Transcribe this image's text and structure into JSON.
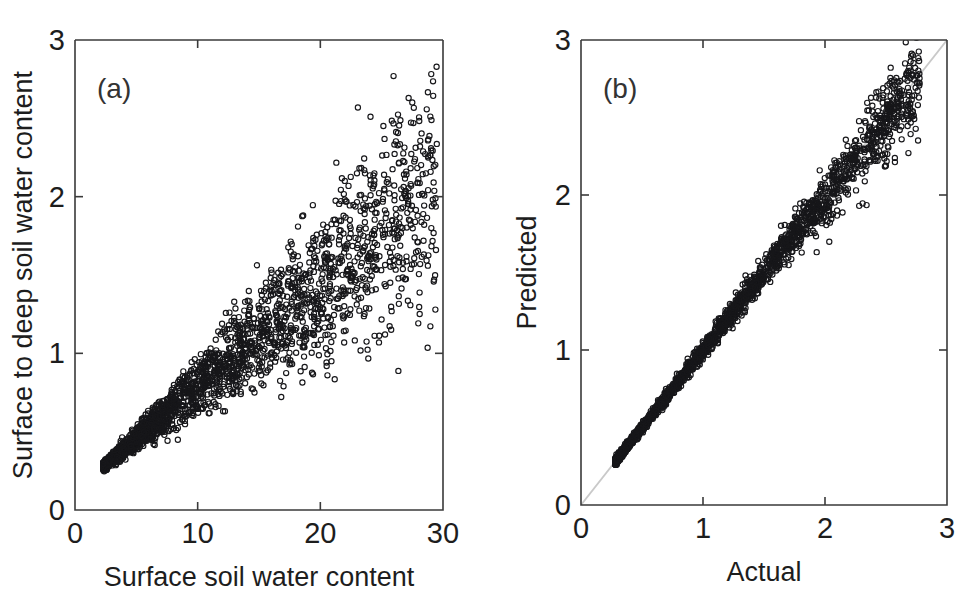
{
  "figure": {
    "background": "#ffffff",
    "panels": [
      {
        "tag": "(a)",
        "xlabel": "Surface soil water content",
        "ylabel": "Surface to deep soil water content",
        "xticks": [
          "0",
          "10",
          "20",
          "30"
        ],
        "yticks": [
          "0",
          "1",
          "2",
          "3"
        ]
      },
      {
        "tag": "(b)",
        "xlabel": "Actual",
        "ylabel": "Predicted",
        "xticks": [
          "0",
          "1",
          "2",
          "3"
        ],
        "yticks": [
          "0",
          "1",
          "2",
          "3"
        ]
      }
    ]
  },
  "chart_data": [
    {
      "type": "scatter",
      "panel": "(a)",
      "title": "",
      "xlabel": "Surface soil water content",
      "ylabel": "Surface to deep soil water content",
      "xlim": [
        0,
        30
      ],
      "ylim": [
        0,
        3
      ],
      "xticks": [
        0,
        10,
        20,
        30
      ],
      "yticks": [
        0,
        1,
        2,
        3
      ],
      "grid": false,
      "legend": null,
      "marker": "open-circle",
      "marker_color": "#17171a",
      "n_points": 2400,
      "description": "Dense fan-shaped point cloud rising from lower-left to upper-right; tight core near (3,0.32) broadening to a wide wedge spanning y from about 1.1 to 2.8 at x near 29.",
      "point_cloud_model": {
        "x_range": [
          2.3,
          29.5
        ],
        "x_distribution": "right-skewed, mode near 9",
        "trend": "y increases roughly linearly with x, slope about 0.062",
        "spread": "standard deviation of y grows from about 0.02 at x=3 to about 0.33 at x=28",
        "streaks": "several near-linear sub-branches of differing slope overlap inside the wedge"
      },
      "reference_points": [
        {
          "x": 2.4,
          "y": 0.3
        },
        {
          "x": 3.0,
          "y": 0.33
        },
        {
          "x": 5.0,
          "y": 0.45
        },
        {
          "x": 7.0,
          "y": 0.58
        },
        {
          "x": 9.0,
          "y": 0.73
        },
        {
          "x": 11.0,
          "y": 0.88
        },
        {
          "x": 13.0,
          "y": 1.02
        },
        {
          "x": 15.0,
          "y": 1.15
        },
        {
          "x": 17.0,
          "y": 1.28
        },
        {
          "x": 19.0,
          "y": 1.4
        },
        {
          "x": 21.0,
          "y": 1.55
        },
        {
          "x": 23.0,
          "y": 1.7
        },
        {
          "x": 25.0,
          "y": 1.85
        },
        {
          "x": 27.0,
          "y": 2.05
        },
        {
          "x": 29.0,
          "y": 2.25
        },
        {
          "x": 28.8,
          "y": 2.78
        },
        {
          "x": 23.5,
          "y": 2.6
        },
        {
          "x": 26.0,
          "y": 2.64
        },
        {
          "x": 20.0,
          "y": 2.15
        },
        {
          "x": 16.0,
          "y": 1.95
        }
      ]
    },
    {
      "type": "scatter",
      "panel": "(b)",
      "title": "",
      "xlabel": "Actual",
      "ylabel": "Predicted",
      "xlim": [
        0,
        3
      ],
      "ylim": [
        0,
        3
      ],
      "xticks": [
        0,
        1,
        2,
        3
      ],
      "yticks": [
        0,
        1,
        2,
        3
      ],
      "grid": false,
      "legend": null,
      "marker": "open-circle",
      "marker_color": "#17171a",
      "n_points": 2400,
      "reference_line": {
        "type": "identity",
        "label": "1:1 line",
        "color": "#c9c9c9",
        "from": [
          0,
          0
        ],
        "to": [
          3,
          3
        ]
      },
      "description": "Predicted versus actual values hugging the 1:1 line; very tight near the origin and fanning slightly above 1.8, with a few points falling below the line near the top of the range.",
      "point_cloud_model": {
        "x_range": [
          0.28,
          2.78
        ],
        "x_distribution": "right-skewed, mode near 0.75",
        "trend": "y approximately equals x",
        "spread": "residual standard deviation grows from about 0.02 at x=0.4 to about 0.13 at x=2.5"
      },
      "reference_points": [
        {
          "x": 0.3,
          "y": 0.31
        },
        {
          "x": 0.5,
          "y": 0.5
        },
        {
          "x": 0.75,
          "y": 0.76
        },
        {
          "x": 1.0,
          "y": 1.0
        },
        {
          "x": 1.25,
          "y": 1.26
        },
        {
          "x": 1.5,
          "y": 1.49
        },
        {
          "x": 1.75,
          "y": 1.76
        },
        {
          "x": 2.0,
          "y": 1.97
        },
        {
          "x": 2.2,
          "y": 2.14
        },
        {
          "x": 2.4,
          "y": 2.28
        },
        {
          "x": 2.6,
          "y": 2.4
        },
        {
          "x": 2.75,
          "y": 2.46
        },
        {
          "x": 2.05,
          "y": 1.88
        },
        {
          "x": 1.85,
          "y": 1.7
        },
        {
          "x": 2.3,
          "y": 2.05
        }
      ]
    }
  ]
}
